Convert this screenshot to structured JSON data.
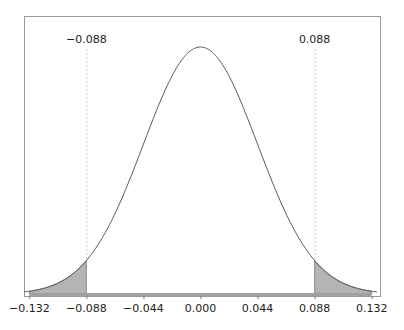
{
  "chart_data": {
    "type": "area",
    "title": "",
    "xlabel": "",
    "ylabel": "",
    "distribution": {
      "mean": 0.0,
      "sd": 0.044
    },
    "xlim": [
      -0.132,
      0.132
    ],
    "x_ticks": [
      -0.132,
      -0.088,
      -0.044,
      0.0,
      0.044,
      0.088,
      0.132
    ],
    "x_tick_labels": [
      "−0.132",
      "−0.088",
      "−0.044",
      "0.000",
      "0.044",
      "0.088",
      "0.132"
    ],
    "critical_values": [
      {
        "value": -0.088,
        "label": "−0.088"
      },
      {
        "value": 0.088,
        "label": "0.088"
      }
    ],
    "shaded_regions": [
      {
        "from": -0.132,
        "to": -0.088,
        "color": "#b4b4b4"
      },
      {
        "from": 0.088,
        "to": 0.132,
        "color": "#b4b4b4"
      }
    ],
    "grid": false,
    "legend": null,
    "colors": {
      "curve": "#555555",
      "frame": "#9a9a9a",
      "shade": "#b4b4b4",
      "dashed": "#c8c8c8",
      "baseline": "#a0a0a0"
    }
  },
  "layout": {
    "frame": {
      "left": 24,
      "top": 16,
      "right": 380,
      "bottom": 296
    },
    "x_origin_px": 200.5,
    "px_per_unit": 1297,
    "baseline_y": 294,
    "peak_y": 47
  }
}
